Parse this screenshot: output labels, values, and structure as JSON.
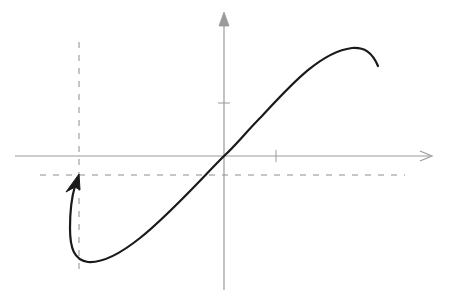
{
  "diagram": {
    "type": "function-graph",
    "colors": {
      "axis": "#9a9a9a",
      "dashed": "#8c8c8c",
      "curve": "#1a1a1a",
      "background": "#ffffff"
    },
    "axes": {
      "origin": [
        224,
        156
      ],
      "x_axis": {
        "from": [
          15,
          156
        ],
        "to": [
          432,
          156
        ],
        "tick_x": 276
      },
      "y_axis": {
        "from": [
          224,
          290
        ],
        "to": [
          224,
          12
        ],
        "tick_y": 103
      }
    },
    "dashed_lines": {
      "vertical": {
        "x": 79,
        "y1": 42,
        "y2": 274
      },
      "horizontal": {
        "y": 175,
        "x1": 40,
        "x2": 405
      }
    },
    "curve": {
      "path": "M 378 66 C 372 52, 364 47, 352 48 C 320 52, 290 86, 262 116 C 246 132, 236 145, 224 156 C 200 180, 170 214, 140 238 C 120 254, 102 263, 88 262 C 74 260, 70 248, 70 228 C 70 210, 72 196, 75 186",
      "arrowhead": {
        "tip": [
          79,
          174
        ],
        "points": "79,174 66,190 76,186 80,188"
      }
    }
  }
}
